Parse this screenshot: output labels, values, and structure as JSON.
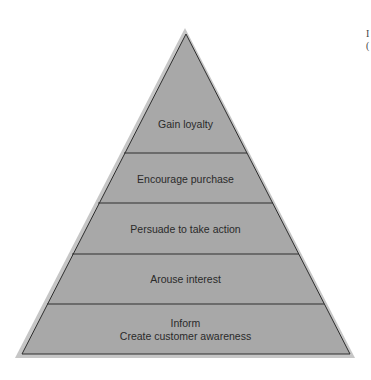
{
  "diagram": {
    "type": "pyramid",
    "colors": {
      "fill": "#a8a8a8",
      "outer_border": "#c6c6c6",
      "lines": "#2e2e2e",
      "text": "#2a2a2a",
      "background": "#ffffff"
    },
    "levels": [
      {
        "label": "Gain loyalty"
      },
      {
        "label": "Encourage purchase"
      },
      {
        "label": "Persuade to take action"
      },
      {
        "label": "Arouse interest"
      },
      {
        "label": "Inform",
        "sublabel": "Create customer awareness"
      }
    ]
  },
  "edge_text": {
    "line1": "I",
    "line2": "("
  }
}
